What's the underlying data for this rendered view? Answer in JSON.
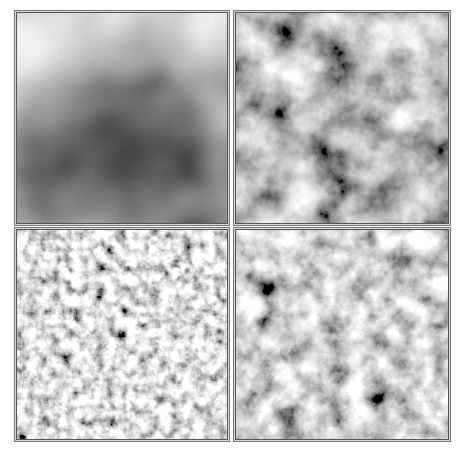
{
  "figure": {
    "layout": "2x2 grid",
    "panels": [
      {
        "id": "p1",
        "position": "top-left",
        "description": "very smooth low-frequency noise, dark center, light top",
        "base_frequency": 0.008,
        "octaves": 3,
        "seed": 4
      },
      {
        "id": "p2",
        "position": "top-right",
        "description": "medium-frequency cloudy noise",
        "base_frequency": 0.025,
        "octaves": 5,
        "seed": 11
      },
      {
        "id": "p3",
        "position": "bottom-left",
        "description": "high-frequency speckled noise",
        "base_frequency": 0.09,
        "octaves": 6,
        "seed": 23
      },
      {
        "id": "p4",
        "position": "bottom-right",
        "description": "mixed-frequency speckled clouds",
        "base_frequency": 0.045,
        "octaves": 6,
        "seed": 7
      }
    ],
    "colors": {
      "background": "#ffffff",
      "frame": "#555555"
    }
  }
}
